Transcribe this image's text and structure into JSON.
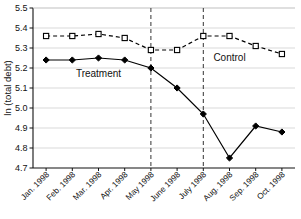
{
  "chart_data": {
    "type": "line",
    "title": "",
    "xlabel": "",
    "ylabel": "ln (total debt)",
    "ylim": [
      4.7,
      5.5
    ],
    "yticks": [
      "4.7",
      "4.8",
      "4.9",
      "5.0",
      "5.1",
      "5.2",
      "5.3",
      "5.4",
      "5.5"
    ],
    "ytick_values": [
      4.7,
      4.8,
      4.9,
      5.0,
      5.1,
      5.2,
      5.3,
      5.4,
      5.5
    ],
    "grid": true,
    "legend_position": "inline-annotation",
    "categories": [
      "Jan. 1998",
      "Feb. 1998",
      "Mar. 1998",
      "Apr. 1998",
      "May 1998",
      "June 1998",
      "July 1998",
      "Aug. 1998",
      "Sep. 1998",
      "Oct. 1998"
    ],
    "series": [
      {
        "name": "Treatment",
        "marker": "filled-diamond",
        "linestyle": "solid",
        "color": "#000000",
        "values": [
          5.24,
          5.24,
          5.25,
          5.24,
          5.2,
          5.1,
          4.97,
          4.75,
          4.91,
          4.88
        ]
      },
      {
        "name": "Control",
        "marker": "open-square",
        "linestyle": "dashed",
        "color": "#000000",
        "values": [
          5.36,
          5.36,
          5.37,
          5.35,
          5.29,
          5.29,
          5.36,
          5.36,
          5.31,
          5.27
        ]
      }
    ],
    "annotations": [
      {
        "text": "Treatment",
        "category_index": 2,
        "value": 5.155
      },
      {
        "text": "Control",
        "category_index": 7,
        "value": 5.235
      }
    ],
    "vertical_reference_lines": [
      {
        "between": [
          "Apr. 1998",
          "May 1998"
        ],
        "position_index": 3.5,
        "style": "dashed"
      },
      {
        "between": [
          "June 1998",
          "July 1998"
        ],
        "position_index": 5.5,
        "style": "dashed"
      }
    ]
  }
}
